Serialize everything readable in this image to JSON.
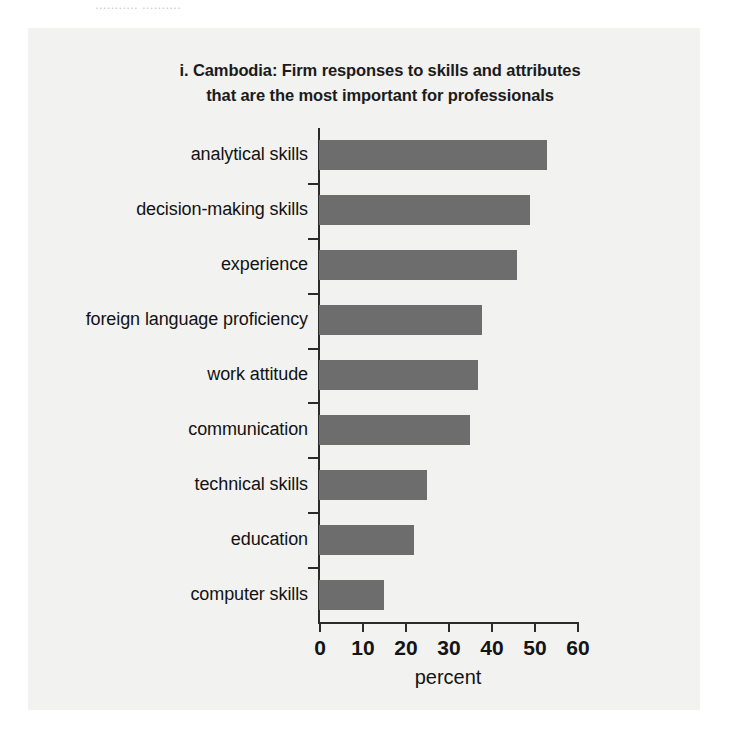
{
  "page": {
    "top_cut_text": "........... ,........."
  },
  "chart_data": {
    "type": "bar",
    "orientation": "horizontal",
    "title": "i. Cambodia: Firm responses to skills and attributes that are the most important for professionals",
    "title_line1": "i. Cambodia: Firm responses to skills and attributes",
    "title_line2": "that are the most important for professionals",
    "xlabel": "percent",
    "ylabel": "",
    "categories": [
      "analytical skills",
      "decision-making skills",
      "experience",
      "foreign language proficiency",
      "work attitude",
      "communication",
      "technical skills",
      "education",
      "computer skills"
    ],
    "values": [
      53,
      49,
      46,
      38,
      37,
      35,
      25,
      22,
      15
    ],
    "xlim": [
      0,
      60
    ],
    "xticks": [
      0,
      10,
      20,
      30,
      40,
      50,
      60
    ],
    "xtick_labels": [
      "0",
      "10",
      "20",
      "30",
      "40",
      "50",
      "60"
    ],
    "grid": false,
    "legend": false,
    "bar_color": "#6d6d6d",
    "axis_color": "#2b2b2b",
    "panel_background": "#f2f2f0",
    "text_color": "#131313"
  }
}
